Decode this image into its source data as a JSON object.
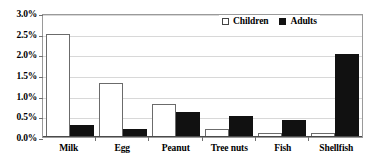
{
  "chart_data": {
    "type": "bar",
    "title": "",
    "xlabel": "",
    "ylabel": "",
    "categories": [
      "Milk",
      "Egg",
      "Peanut",
      "Tree nuts",
      "Fish",
      "Shellfish"
    ],
    "series": [
      {
        "name": "Children",
        "values": [
          2.5,
          1.3,
          0.8,
          0.2,
          0.1,
          0.1
        ],
        "color": "#ffffff"
      },
      {
        "name": "Adults",
        "values": [
          0.3,
          0.2,
          0.6,
          0.5,
          0.4,
          2.0
        ],
        "color": "#111111"
      }
    ],
    "ylim": [
      0,
      3.0
    ],
    "ytick_values": [
      0.0,
      0.5,
      1.0,
      1.5,
      2.0,
      2.5,
      3.0
    ],
    "ytick_labels": [
      "0.0%",
      "0.5%",
      "1.0%",
      "1.5%",
      "2.0%",
      "2.5%",
      "3.0%"
    ],
    "grid": true,
    "legend_position": "top-right",
    "value_suffix": "%"
  },
  "legend": {
    "items": [
      {
        "label": "Children",
        "marker": "open-square"
      },
      {
        "label": "Adults",
        "marker": "filled-square"
      }
    ]
  },
  "colors": {
    "children_fill": "#ffffff",
    "children_stroke": "#6b6b6b",
    "adults_fill": "#111111",
    "gridline": "#d8d8d8",
    "plot_border": "#9a9a9a",
    "text": "#000000"
  }
}
